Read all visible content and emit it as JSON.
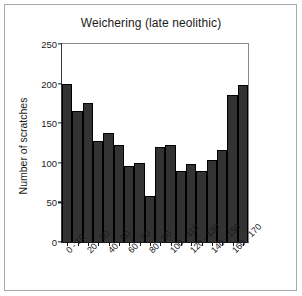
{
  "chart_data": {
    "type": "bar",
    "title": "Weichering (late neolithic)",
    "xlabel": "",
    "ylabel": "Number of scratches",
    "ylim": [
      0,
      250
    ],
    "yticks": [
      0,
      50,
      100,
      150,
      200,
      250
    ],
    "grid": false,
    "legend": null,
    "categories": [
      "0 - 10",
      "10 - 20",
      "20 - 30",
      "30 - 40",
      "40 - 50",
      "50 - 60",
      "60 - 70",
      "70 - 80",
      "80 - 90",
      "90 - 100",
      "100 - 110",
      "110 - 120",
      "120 - 130",
      "130 - 140",
      "140 - 150",
      "150 - 160",
      "160 - 170",
      "170 - 180"
    ],
    "visible_tick_labels": [
      "0 - 10",
      "20 - 30",
      "40 - 50",
      "60 - 70",
      "80 - 90",
      "100 - 110",
      "120 - 130",
      "140 - 150",
      "160 - 170"
    ],
    "values": [
      200,
      165,
      175,
      128,
      138,
      122,
      96,
      100,
      58,
      120,
      122,
      90,
      98,
      90,
      103,
      116,
      185,
      198
    ]
  },
  "colors": {
    "bar_fill": "#333333",
    "bar_edge": "#000000",
    "axis": "#1a1a1a",
    "frame": "#a8a8a8",
    "background": "#ffffff",
    "text": "#1a1a1a"
  }
}
